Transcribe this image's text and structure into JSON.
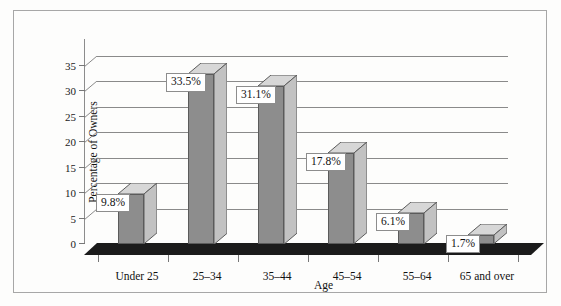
{
  "chart_data": {
    "type": "bar",
    "title": "",
    "xlabel": "Age",
    "ylabel": "Percentage of Owners",
    "categories": [
      "Under 25",
      "25–34",
      "35–44",
      "45–54",
      "55–64",
      "65 and over"
    ],
    "values": [
      9.8,
      33.5,
      31.1,
      17.8,
      6.1,
      1.7
    ],
    "data_labels": [
      "9.8%",
      "33.5%",
      "31.1%",
      "17.8%",
      "6.1%",
      "1.7%"
    ],
    "ylim": [
      0,
      35
    ],
    "yticks": [
      0,
      5,
      10,
      15,
      20,
      25,
      30,
      35
    ],
    "ytick_labels": [
      "0",
      "5",
      "10",
      "15",
      "20",
      "25",
      "30",
      "35"
    ],
    "grid": true,
    "legend": false,
    "style": "3d-column",
    "colors": {
      "bar_front": "#8d8d8d",
      "bar_side": "#c2c2c2",
      "bar_top": "#d7d7d7",
      "bar_edge": "#5b5b5b",
      "gridline": "#8a8a8a",
      "floor": "#1b1b1b",
      "frame": "#a7a7a7",
      "background": "#fdfdfc",
      "label_box_bg": "#ffffff",
      "label_box_border": "#8d8d8d",
      "text": "#111111"
    }
  }
}
